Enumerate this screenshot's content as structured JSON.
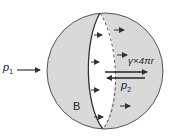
{
  "diagram": {
    "labels": {
      "p1_main": "p",
      "p1_sub": "1",
      "p2_main": "p",
      "p2_sub": "2",
      "surface_tension": "γ×4πr",
      "region": "B"
    },
    "colors": {
      "sphere_fill": "#d9d9d9",
      "cut_face": "#ffffff",
      "stroke": "#333333"
    },
    "elements": [
      {
        "type": "sphere",
        "label": "B"
      },
      {
        "type": "cut-plane",
        "outline": "solid-left, dashed-right"
      },
      {
        "type": "arrow",
        "label": "p1",
        "direction": "right"
      },
      {
        "type": "arrow",
        "label": "γ×4πr",
        "direction": "right"
      },
      {
        "type": "arrow",
        "label": "p2",
        "direction": "left"
      },
      {
        "type": "pressure-arrows",
        "count": 9,
        "direction": "right"
      }
    ]
  }
}
